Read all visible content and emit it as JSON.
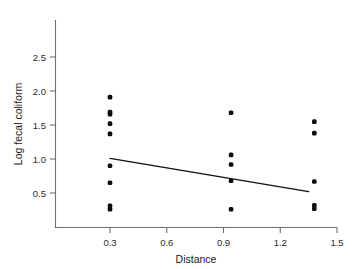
{
  "chart_data": {
    "type": "scatter",
    "title": "",
    "xlabel": "Distance",
    "ylabel": "Log fecal coliform",
    "xlim": [
      0.0,
      1.6
    ],
    "ylim": [
      0.05,
      2.85
    ],
    "xticks": [
      0.3,
      0.6,
      0.9,
      1.2,
      1.5
    ],
    "xticklabels": [
      "0.3",
      "0.6",
      "0.9",
      "1.2",
      "1.5"
    ],
    "yticks": [
      0.5,
      1.0,
      1.5,
      2.0,
      2.5
    ],
    "yticklabels": [
      "0.5",
      "1.0",
      "1.5",
      "2.0",
      "2.5"
    ],
    "grid": false,
    "legend": null,
    "points": [
      {
        "x": 0.3,
        "y": 1.91
      },
      {
        "x": 0.3,
        "y": 1.69
      },
      {
        "x": 0.3,
        "y": 1.66
      },
      {
        "x": 0.3,
        "y": 1.52
      },
      {
        "x": 0.3,
        "y": 1.37
      },
      {
        "x": 0.3,
        "y": 0.9
      },
      {
        "x": 0.3,
        "y": 0.65
      },
      {
        "x": 0.3,
        "y": 0.31
      },
      {
        "x": 0.3,
        "y": 0.26
      },
      {
        "x": 0.94,
        "y": 1.68
      },
      {
        "x": 0.94,
        "y": 1.06
      },
      {
        "x": 0.94,
        "y": 0.92
      },
      {
        "x": 0.94,
        "y": 0.68
      },
      {
        "x": 0.94,
        "y": 0.26
      },
      {
        "x": 1.38,
        "y": 1.55
      },
      {
        "x": 1.38,
        "y": 1.38
      },
      {
        "x": 1.38,
        "y": 0.67
      },
      {
        "x": 1.38,
        "y": 0.32
      },
      {
        "x": 1.38,
        "y": 0.27
      }
    ],
    "fit_line": {
      "name": "regression-line",
      "x": [
        0.3,
        1.35
      ],
      "y": [
        1.01,
        0.52
      ]
    },
    "colors": {
      "marker": "#0d0d0d",
      "line": "#101010",
      "axis": "#6f6f6f",
      "text": "#1a1a1a",
      "background": "#ffffff"
    }
  }
}
